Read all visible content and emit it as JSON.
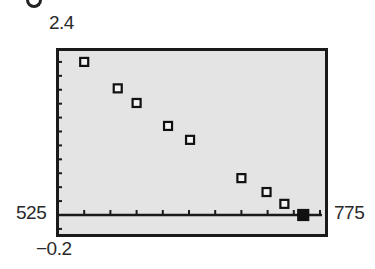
{
  "window": {
    "ymax_label": "2.4",
    "ymin_label": "−0.2",
    "xmin_label": "525",
    "xmax_label": "775"
  },
  "colors": {
    "background": "#e4e4e4",
    "frame": "#1a1a1a",
    "marker": "#111111"
  },
  "chart_data": {
    "type": "scatter",
    "title": "",
    "xlabel": "",
    "ylabel": "",
    "xlim": [
      525,
      775
    ],
    "ylim": [
      -0.2,
      2.4
    ],
    "x_tick_step": 25,
    "y_tick_step": 0.2,
    "grid": false,
    "legend": null,
    "marker": "hollow-square",
    "x": [
      550,
      582,
      600,
      630,
      651,
      700,
      724,
      741,
      759
    ],
    "y": [
      2.2,
      1.82,
      1.61,
      1.28,
      1.08,
      0.53,
      0.33,
      0.16,
      0.0
    ]
  }
}
